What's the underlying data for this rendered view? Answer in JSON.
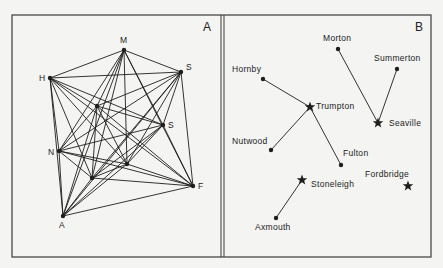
{
  "panels": [
    {
      "id": "A",
      "label": "A",
      "type": "complete-graph",
      "nodes": [
        {
          "id": "M",
          "label": "M",
          "x": 124,
          "y": 50,
          "lx": -4,
          "ly": -7
        },
        {
          "id": "H",
          "label": "H",
          "x": 50,
          "y": 78,
          "lx": -11,
          "ly": 3
        },
        {
          "id": "S1",
          "label": "S",
          "x": 181,
          "y": 72,
          "lx": 5,
          "ly": -2
        },
        {
          "id": "S2",
          "label": "S",
          "x": 163,
          "y": 125,
          "lx": 5,
          "ly": 3
        },
        {
          "id": "N",
          "label": "N",
          "x": 59,
          "y": 151,
          "lx": -11,
          "ly": 4
        },
        {
          "id": "F",
          "label": "F",
          "x": 193,
          "y": 186,
          "lx": 5,
          "ly": 3
        },
        {
          "id": "A",
          "label": "A",
          "x": 63,
          "y": 216,
          "lx": -4,
          "ly": 12
        },
        {
          "id": "I1",
          "label": "",
          "x": 97,
          "y": 106,
          "lx": 0,
          "ly": 0
        },
        {
          "id": "I2",
          "label": "",
          "x": 127,
          "y": 164,
          "lx": 0,
          "ly": 0
        },
        {
          "id": "I3",
          "label": "",
          "x": 92,
          "y": 178,
          "lx": 0,
          "ly": 0
        }
      ]
    },
    {
      "id": "B",
      "label": "B",
      "type": "central-place-links",
      "nodes": [
        {
          "id": "morton",
          "label": "Morton",
          "kind": "dot",
          "x": 338,
          "y": 49,
          "lx": -15,
          "ly": -8
        },
        {
          "id": "summerton",
          "label": "Summerton",
          "kind": "dot",
          "x": 397,
          "y": 69,
          "lx": -23,
          "ly": -8
        },
        {
          "id": "hornby",
          "label": "Hornby",
          "kind": "dot",
          "x": 263,
          "y": 79,
          "lx": -31,
          "ly": -7
        },
        {
          "id": "trumpton",
          "label": "Trumpton",
          "kind": "star",
          "x": 310,
          "y": 107,
          "lx": 6,
          "ly": 2
        },
        {
          "id": "seaville",
          "label": "Seaville",
          "kind": "star",
          "x": 378,
          "y": 123,
          "lx": 11,
          "ly": 3
        },
        {
          "id": "nutwood",
          "label": "Nutwood",
          "kind": "dot",
          "x": 271,
          "y": 150,
          "lx": -39,
          "ly": -6
        },
        {
          "id": "fulton",
          "label": "Fulton",
          "kind": "dot",
          "x": 341,
          "y": 165,
          "lx": 2,
          "ly": -9
        },
        {
          "id": "stoneleigh",
          "label": "Stoneleigh",
          "kind": "star",
          "x": 302,
          "y": 180,
          "lx": 9,
          "ly": 7
        },
        {
          "id": "fordbridge",
          "label": "Fordbridge",
          "kind": "star",
          "x": 408,
          "y": 186,
          "lx": -43,
          "ly": -9
        },
        {
          "id": "axmouth",
          "label": "Axmouth",
          "kind": "dot",
          "x": 276,
          "y": 218,
          "lx": -21,
          "ly": 12
        }
      ],
      "links": [
        [
          "hornby",
          "trumpton"
        ],
        [
          "nutwood",
          "trumpton"
        ],
        [
          "fulton",
          "trumpton"
        ],
        [
          "morton",
          "seaville"
        ],
        [
          "summerton",
          "seaville"
        ],
        [
          "axmouth",
          "stoneleigh"
        ]
      ]
    }
  ],
  "colors": {
    "ink": "#1e1e1e",
    "paper": "#f4f4f2",
    "frame": "#3a3a3a"
  }
}
